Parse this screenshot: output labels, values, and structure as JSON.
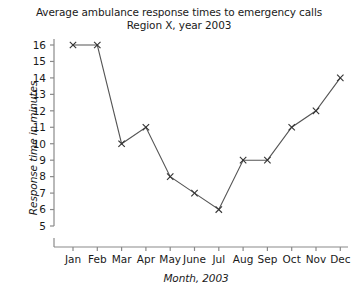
{
  "chart_data": {
    "type": "line",
    "title": "Average ambulance response times to emergency calls",
    "subtitle": "Region X, year 2003",
    "xlabel": "Month, 2003",
    "ylabel": "Response time in minutes",
    "categories": [
      "Jan",
      "Feb",
      "Mar",
      "Apr",
      "May",
      "June",
      "Jul",
      "Aug",
      "Sep",
      "Oct",
      "Nov",
      "Dec"
    ],
    "values": [
      16,
      16,
      10,
      11,
      8,
      7,
      6,
      9,
      9,
      11,
      12,
      14
    ],
    "series": [
      {
        "name": "Average response time",
        "values": [
          16,
          16,
          10,
          11,
          8,
          7,
          6,
          9,
          9,
          11,
          12,
          14
        ]
      }
    ],
    "ylim": [
      5,
      16
    ],
    "yticks": [
      5,
      6,
      7,
      8,
      9,
      10,
      11,
      12,
      13,
      14,
      15,
      16
    ],
    "ytick_labels": [
      "5",
      "6",
      "7",
      "8",
      "9",
      "10",
      "11",
      "12",
      "13",
      "14",
      "15",
      "16"
    ],
    "y_axis_break": true,
    "grid": false,
    "legend": "none",
    "marker": "x-cross",
    "line_color": "#555555",
    "marker_color": "#333333",
    "axis_color": "#8a8a8a",
    "background_color": "#ffffff"
  }
}
